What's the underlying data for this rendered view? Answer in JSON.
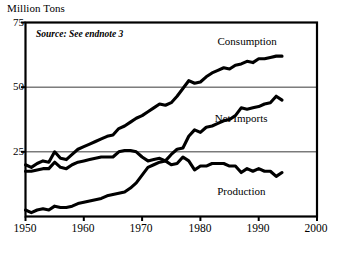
{
  "chart_data": {
    "type": "line",
    "title": "",
    "subtitle": "",
    "xlabel": "",
    "ylabel": "Million Tons",
    "xlim": [
      1950,
      2000
    ],
    "ylim": [
      0,
      75
    ],
    "grid": "horizontal gridlines at 25 and 50",
    "legend_position": "inline labels at right of each series",
    "annotations": [
      {
        "text": "Source: See endnote 3",
        "x": 1952,
        "y": 70,
        "style": "bold-italic"
      }
    ],
    "x_ticks": [
      1950,
      1960,
      1970,
      1980,
      1990,
      2000
    ],
    "y_ticks": [
      25,
      50,
      75
    ],
    "x": [
      1950,
      1951,
      1952,
      1953,
      1954,
      1955,
      1956,
      1957,
      1958,
      1959,
      1960,
      1961,
      1962,
      1963,
      1964,
      1965,
      1966,
      1967,
      1968,
      1969,
      1970,
      1971,
      1972,
      1973,
      1974,
      1975,
      1976,
      1977,
      1978,
      1979,
      1980,
      1981,
      1982,
      1983,
      1984,
      1985,
      1986,
      1987,
      1988,
      1989,
      1990,
      1991,
      1992,
      1993,
      1994
    ],
    "series": [
      {
        "name": "Consumption",
        "label_x": 1988,
        "label_y": 68,
        "values": [
          20.0,
          19.0,
          20.5,
          21.5,
          21.0,
          25.0,
          22.5,
          22.0,
          24.0,
          26.0,
          27.0,
          28.0,
          29.0,
          30.0,
          31.0,
          31.5,
          34.0,
          35.0,
          36.5,
          38.0,
          39.0,
          40.5,
          42.0,
          43.5,
          43.0,
          44.0,
          46.5,
          49.5,
          52.5,
          51.5,
          52.0,
          54.0,
          55.5,
          56.5,
          57.5,
          57.0,
          58.5,
          59.0,
          60.0,
          59.5,
          61.0,
          61.0,
          61.5,
          62.0,
          62.0
        ]
      },
      {
        "name": "Net Imports",
        "label_x": 1987,
        "label_y": 38,
        "values": [
          2.5,
          1.5,
          2.5,
          3.0,
          2.5,
          4.0,
          3.5,
          3.5,
          4.0,
          5.0,
          5.5,
          6.0,
          6.5,
          7.0,
          8.0,
          8.5,
          9.0,
          9.5,
          11.0,
          13.0,
          16.0,
          19.0,
          20.0,
          21.0,
          21.5,
          24.0,
          26.0,
          26.5,
          31.0,
          33.5,
          32.5,
          34.5,
          35.0,
          36.0,
          37.0,
          37.5,
          39.0,
          42.0,
          41.5,
          42.0,
          42.5,
          43.5,
          44.0,
          46.5,
          45.0
        ]
      },
      {
        "name": "Production",
        "label_x": 1987,
        "label_y": 10,
        "values": [
          17.5,
          17.5,
          18.0,
          18.5,
          18.5,
          21.0,
          19.0,
          18.5,
          20.0,
          21.0,
          21.5,
          22.0,
          22.5,
          23.0,
          23.0,
          23.0,
          25.0,
          25.5,
          25.5,
          25.0,
          23.0,
          21.5,
          22.0,
          22.5,
          21.5,
          20.0,
          20.5,
          23.0,
          21.5,
          18.0,
          19.5,
          19.5,
          20.5,
          20.5,
          20.5,
          19.5,
          19.5,
          17.0,
          18.5,
          17.5,
          18.5,
          17.5,
          17.5,
          15.5,
          17.0
        ]
      }
    ]
  },
  "axes": {
    "y_axis_title": "Million Tons",
    "y_tick_labels": [
      "75",
      "50",
      "25"
    ],
    "x_tick_labels": [
      "1950",
      "1960",
      "1970",
      "1980",
      "1990",
      "2000"
    ]
  },
  "caption": {
    "partial_text": ""
  },
  "colors": {
    "ink": "#000000",
    "background": "#ffffff",
    "gridline": "#3a3a3a",
    "frame": "#000000"
  }
}
